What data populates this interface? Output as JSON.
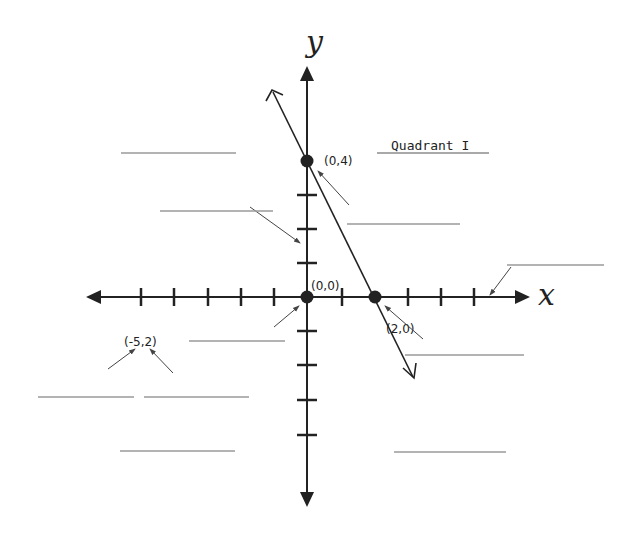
{
  "diagram": {
    "axes": {
      "x_label": "x",
      "y_label": "y"
    },
    "quadrant_label": "Quadrant I",
    "points": [
      {
        "label": "(0,4)",
        "x": 0,
        "y": 4
      },
      {
        "label": "(0,0)",
        "x": 0,
        "y": 0
      },
      {
        "label": "(2,0)",
        "x": 2,
        "y": 0
      }
    ],
    "unplotted_label": "(-5,2)",
    "line": {
      "through": [
        "(0,4)",
        "(2,0)"
      ]
    },
    "blank_answer_lines": 11,
    "colors": {
      "ink": "#222222",
      "blank_line": "#9a9a9a",
      "background": "#ffffff"
    }
  }
}
